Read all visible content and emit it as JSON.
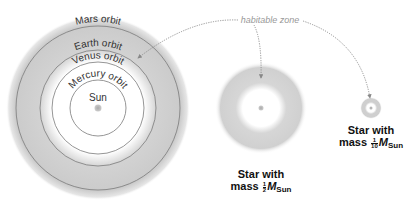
{
  "diagram": {
    "sun_system": {
      "center_label": "Sun",
      "orbits": [
        {
          "name": "Mercury orbit"
        },
        {
          "name": "Venus orbit"
        },
        {
          "name": "Earth orbit"
        },
        {
          "name": "Mars orbit"
        }
      ]
    },
    "habitable_zone_label": "habitable zone",
    "stars": [
      {
        "caption_line1": "Star with",
        "caption_prefix": "mass",
        "fraction_num": "1",
        "fraction_den": "2",
        "mass_symbol": "M",
        "mass_subscript": "Sun"
      },
      {
        "caption_line1": "Star with",
        "caption_prefix": "mass",
        "fraction_num": "1",
        "fraction_den": "10",
        "mass_symbol": "M",
        "mass_subscript": "Sun"
      }
    ],
    "colors": {
      "habitable_zone": "#c8c8c8",
      "orbit_line": "#777777",
      "star": "#b0b0b0",
      "leader_line": "#888888"
    }
  }
}
